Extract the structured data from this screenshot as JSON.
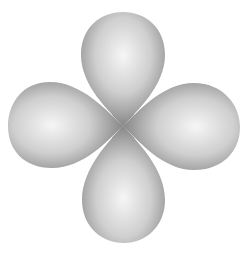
{
  "figure": {
    "lobes": [
      "top",
      "left",
      "right",
      "bottom"
    ],
    "colors": {
      "background": "#ffffff",
      "lobe_highlight": "#f4f4f4",
      "lobe_mid": "#c9c9c9",
      "lobe_edge": "#8e8e8e"
    }
  }
}
